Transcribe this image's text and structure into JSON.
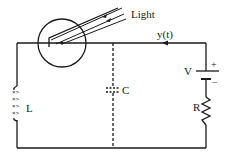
{
  "diagram": {
    "type": "circuit",
    "labels": {
      "light": "Light",
      "current": "y(t)",
      "voltage_source": "V",
      "plus": "+",
      "minus": "−",
      "resistor": "R",
      "inductor": "L",
      "capacitor": "C"
    },
    "components": [
      {
        "id": "phototube",
        "label": "",
        "description": "circle with photocathode illuminated by light"
      },
      {
        "id": "inductor",
        "label": "L"
      },
      {
        "id": "capacitor",
        "label": "C",
        "style": "dashed"
      },
      {
        "id": "battery",
        "label": "V",
        "polarity": [
          "+",
          "−"
        ]
      },
      {
        "id": "resistor",
        "label": "R"
      }
    ],
    "colors": {
      "ink": "#1a1a1a",
      "background": "#ffffff"
    }
  }
}
